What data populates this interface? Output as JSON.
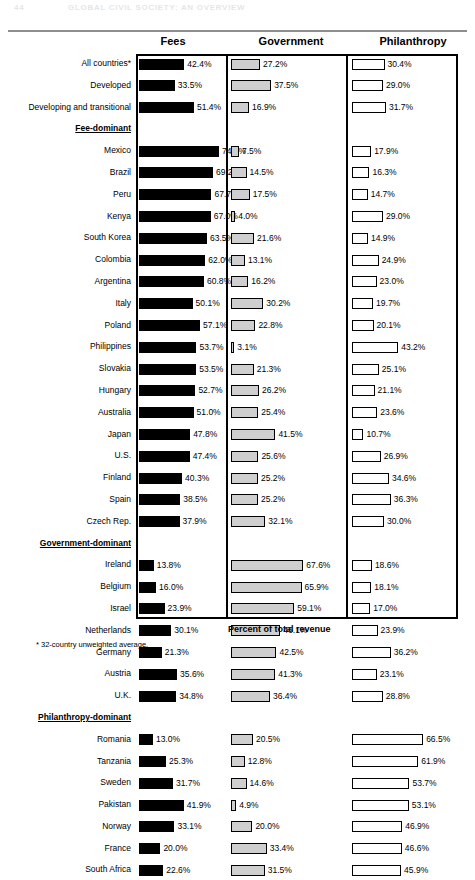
{
  "running_head": {
    "page_number": "44",
    "title": "GLOBAL CIVIL SOCIETY:  AN OVERVIEW"
  },
  "axis_caption": "Percent of total revenue",
  "footnote": "* 32-country unweighted average.",
  "chart_data": {
    "type": "bar",
    "title": "",
    "xlabel": "Percent of total revenue",
    "ylabel": "",
    "xlim": [
      0,
      80
    ],
    "grid": false,
    "legend_position": "column-headers",
    "orientation": "horizontal",
    "panels": [
      "Fees",
      "Government",
      "Philanthropy"
    ],
    "panel_styles": {
      "Fees": "#000000",
      "Government": "#cfcfcf",
      "Philanthropy": "#ffffff"
    },
    "categories": [
      "All countries*",
      "Developed",
      "Developing and transitional",
      "Fee-dominant",
      "Mexico",
      "Brazil",
      "Peru",
      "Kenya",
      "South Korea",
      "Colombia",
      "Argentina",
      "Italy",
      "Poland",
      "Philippines",
      "Slovakia",
      "Hungary",
      "Australia",
      "Japan",
      "U.S.",
      "Finland",
      "Spain",
      "Czech Rep.",
      "Government-dominant",
      "Ireland",
      "Belgium",
      "Israel",
      "Netherlands",
      "Germany",
      "Austria",
      "U.K.",
      "Philanthropy-dominant",
      "Romania",
      "Tanzania",
      "Sweden",
      "Pakistan",
      "Norway",
      "France",
      "South Africa"
    ],
    "group_rows": [
      "Fee-dominant",
      "Government-dominant",
      "Philanthropy-dominant"
    ],
    "series": [
      {
        "name": "Fees",
        "values": [
          42.4,
          33.5,
          51.4,
          null,
          74.7,
          69.2,
          67.7,
          67.0,
          63.5,
          62.0,
          60.8,
          50.1,
          57.1,
          53.7,
          53.5,
          52.7,
          51.0,
          47.8,
          47.4,
          40.3,
          38.5,
          37.9,
          null,
          13.8,
          16.0,
          23.9,
          30.1,
          21.3,
          35.6,
          34.8,
          null,
          13.0,
          25.3,
          31.7,
          41.9,
          33.1,
          20.0,
          22.6
        ]
      },
      {
        "name": "Government",
        "values": [
          27.2,
          37.5,
          16.9,
          null,
          7.5,
          14.5,
          17.5,
          4.0,
          21.6,
          13.1,
          16.2,
          30.2,
          22.8,
          3.1,
          21.3,
          26.2,
          25.4,
          41.5,
          25.6,
          25.2,
          25.2,
          32.1,
          null,
          67.6,
          65.9,
          59.1,
          46.1,
          42.5,
          41.3,
          36.4,
          null,
          20.5,
          12.8,
          14.6,
          4.9,
          20.0,
          33.4,
          31.5
        ]
      },
      {
        "name": "Philanthropy",
        "values": [
          30.4,
          29.0,
          31.7,
          null,
          17.9,
          16.3,
          14.7,
          29.0,
          14.9,
          24.9,
          23.0,
          19.7,
          20.1,
          43.2,
          25.1,
          21.1,
          23.6,
          10.7,
          26.9,
          34.6,
          36.3,
          30.0,
          null,
          18.6,
          18.1,
          17.0,
          23.9,
          36.2,
          23.1,
          28.8,
          null,
          66.5,
          61.9,
          53.7,
          53.1,
          46.9,
          46.6,
          45.9
        ]
      }
    ],
    "labels": {
      "Fees": [
        "42.4%",
        "33.5%",
        "51.4%",
        null,
        "74.7%",
        "69.2%",
        "67.7%",
        "67.0%",
        "63.5%",
        "62.0%",
        "60.8%",
        "50.1%",
        "57.1%",
        "53.7%",
        "53.5%",
        "52.7%",
        "51.0%",
        "47.8%",
        "47.4%",
        "40.3%",
        "38.5%",
        "37.9%",
        null,
        "13.8%",
        "16.0%",
        "23.9%",
        "30.1%",
        "21.3%",
        "35.6%",
        "34.8%",
        null,
        "13.0%",
        "25.3%",
        "31.7%",
        "41.9%",
        "33.1%",
        "20.0%",
        "22.6%"
      ],
      "Government": [
        "27.2%",
        "37.5%",
        "16.9%",
        null,
        "7.5%",
        "14.5%",
        "17.5%",
        "4.0%",
        "21.6%",
        "13.1%",
        "16.2%",
        "30.2%",
        "22.8%",
        "3.1%",
        "21.3%",
        "26.2%",
        "25.4%",
        "41.5%",
        "25.6%",
        "25.2%",
        "25.2%",
        "32.1%",
        null,
        "67.6%",
        "65.9%",
        "59.1%",
        "46.1%",
        "42.5%",
        "41.3%",
        "36.4%",
        null,
        "20.5%",
        "12.8%",
        "14.6%",
        "4.9%",
        "20.0%",
        "33.4%",
        "31.5%"
      ],
      "Philanthropy": [
        "30.4%",
        "29.0%",
        "31.7%",
        null,
        "17.9%",
        "16.3%",
        "14.7%",
        "29.0%",
        "14.9%",
        "24.9%",
        "23.0%",
        "19.7%",
        "20.1%",
        "43.2%",
        "25.1%",
        "21.1%",
        "23.6%",
        "10.7%",
        "26.9%",
        "34.6%",
        "36.3%",
        "30.0%",
        null,
        "18.6%",
        "18.1%",
        "17.0%",
        "23.9%",
        "36.2%",
        "23.1%",
        "28.8%",
        null,
        "66.5%",
        "61.9%",
        "53.7%",
        "53.1%",
        "46.9%",
        "46.6%",
        "45.9%"
      ]
    }
  }
}
